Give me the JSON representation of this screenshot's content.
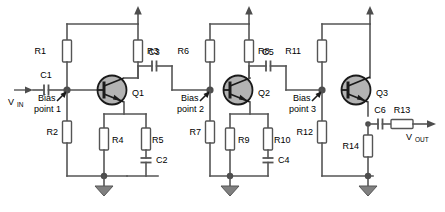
{
  "diagram": {
    "type": "schematic",
    "signals": {
      "input_label": "V",
      "input_sub": "IN",
      "output_label": "V",
      "output_sub": "OUT"
    },
    "annotations": [
      {
        "name": "bias-point-1",
        "line1": "Bias",
        "line2": "point 1"
      },
      {
        "name": "bias-point-2",
        "line1": "Bias",
        "line2": "point 2"
      },
      {
        "name": "bias-point-3",
        "line1": "Bias",
        "line2": "point 3"
      }
    ],
    "transistors": [
      {
        "ref": "Q1",
        "type": "npn"
      },
      {
        "ref": "Q2",
        "type": "npn"
      },
      {
        "ref": "Q3",
        "type": "npn"
      }
    ],
    "resistors": [
      {
        "ref": "R1",
        "role": "stage1-bias-upper"
      },
      {
        "ref": "R2",
        "role": "stage1-bias-lower"
      },
      {
        "ref": "R3",
        "role": "stage1-collector"
      },
      {
        "ref": "R4",
        "role": "stage1-emitter"
      },
      {
        "ref": "R5",
        "role": "stage1-emitter-bypassed"
      },
      {
        "ref": "R6",
        "role": "stage2-bias-upper"
      },
      {
        "ref": "R7",
        "role": "stage2-bias-lower"
      },
      {
        "ref": "R8",
        "role": "stage2-collector"
      },
      {
        "ref": "R9",
        "role": "stage2-emitter"
      },
      {
        "ref": "R10",
        "role": "stage2-emitter-bypassed"
      },
      {
        "ref": "R11",
        "role": "stage3-bias-upper"
      },
      {
        "ref": "R12",
        "role": "stage3-bias-lower"
      },
      {
        "ref": "R13",
        "role": "output-series"
      },
      {
        "ref": "R14",
        "role": "stage3-emitter"
      }
    ],
    "capacitors": [
      {
        "ref": "C1",
        "role": "input-coupling"
      },
      {
        "ref": "C2",
        "role": "stage1-emitter-bypass"
      },
      {
        "ref": "C3",
        "role": "stage1-to-stage2-coupling"
      },
      {
        "ref": "C4",
        "role": "stage2-emitter-bypass"
      },
      {
        "ref": "C5",
        "role": "stage2-to-stage3-coupling"
      },
      {
        "ref": "C6",
        "role": "output-coupling"
      }
    ],
    "supply_rails": [
      {
        "name": "supply-arrow-1"
      },
      {
        "name": "supply-arrow-2"
      },
      {
        "name": "supply-arrow-3"
      }
    ],
    "grounds": [
      {
        "name": "ground-1"
      },
      {
        "name": "ground-2"
      },
      {
        "name": "ground-3"
      }
    ],
    "colors": {
      "wire": "#555555",
      "device_body": "#b3b3b3",
      "device_outline": "#1a1a1a",
      "background": "#ffffff",
      "ground": "#808080"
    }
  }
}
